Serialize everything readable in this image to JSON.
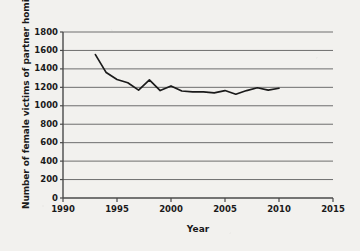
{
  "chart_data": {
    "type": "line",
    "title": "",
    "xlabel": "Year",
    "ylabel": "Number of female victims of partner homicide",
    "xlim": [
      1990,
      2015
    ],
    "ylim": [
      0,
      1800
    ],
    "xticks": [
      1990,
      1995,
      2000,
      2005,
      2010,
      2015
    ],
    "yticks": [
      0,
      200,
      400,
      600,
      800,
      1000,
      1200,
      1400,
      1600,
      1800
    ],
    "grid": true,
    "legend": false,
    "series": [
      {
        "name": "Female victims of partner homicide",
        "color": "#1a1a1a",
        "x": [
          1993,
          1994,
          1995,
          1996,
          1997,
          1998,
          1999,
          2000,
          2001,
          2002,
          2003,
          2004,
          2005,
          2006,
          2007,
          2008,
          2009,
          2010
        ],
        "values": [
          1555,
          1360,
          1285,
          1250,
          1170,
          1280,
          1165,
          1215,
          1160,
          1150,
          1150,
          1140,
          1165,
          1125,
          1165,
          1195,
          1170,
          1190
        ]
      }
    ]
  },
  "axes": {
    "y_tick_labels": [
      "1800",
      "1600",
      "1400",
      "1200",
      "1000",
      "800",
      "600",
      "400",
      "200",
      "0"
    ],
    "x_tick_labels": [
      "1990",
      "1995",
      "2000",
      "2005",
      "2010",
      "2015"
    ],
    "y_axis_title": "Number of female victims of partner homicide",
    "x_axis_title": "Year"
  },
  "style": {
    "background_color": "#f2f1ee",
    "grid_color": "#6e6e6e",
    "axis_color": "#4a4a4a",
    "line_color": "#1a1a1a",
    "text_color": "#1a1a1a"
  }
}
